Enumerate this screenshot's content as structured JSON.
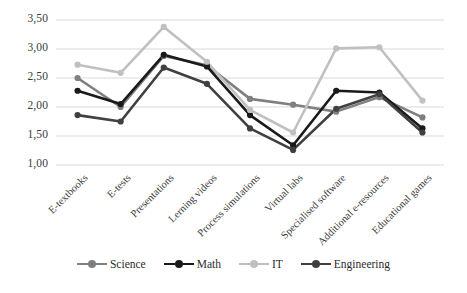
{
  "chart_data": {
    "type": "line",
    "title": "",
    "subtitle": "",
    "xlabel": "",
    "ylabel": "",
    "ylim": [
      1.0,
      3.5
    ],
    "ytick_labels": [
      "1,00",
      "1,50",
      "2,00",
      "2,50",
      "3,00",
      "3,50"
    ],
    "ytick_values": [
      1.0,
      1.5,
      2.0,
      2.5,
      3.0,
      3.5
    ],
    "grid": "horizontal",
    "legend_position": "bottom",
    "decimal_separator": ",",
    "categories": [
      "E-textbooks",
      "E-tests",
      "Presentations",
      "Lerning videos",
      "Process simulations",
      "Virtual labs",
      "Specialised software",
      "Additional e-resources",
      "Educational games"
    ],
    "series": [
      {
        "name": "Science",
        "color": "#7f7f7f",
        "values": [
          2.5,
          2.0,
          2.88,
          2.72,
          2.14,
          2.04,
          1.92,
          2.17,
          1.82
        ]
      },
      {
        "name": "Math",
        "color": "#1a1a1a",
        "values": [
          2.28,
          2.05,
          2.9,
          2.7,
          1.86,
          1.34,
          2.28,
          2.25,
          1.63
        ]
      },
      {
        "name": "IT",
        "color": "#c0c0c0",
        "values": [
          2.73,
          2.59,
          3.38,
          2.78,
          1.95,
          1.56,
          3.01,
          3.03,
          2.11
        ]
      },
      {
        "name": "Engineering",
        "color": "#404040",
        "values": [
          1.86,
          1.75,
          2.68,
          2.4,
          1.63,
          1.26,
          1.97,
          2.22,
          1.56
        ]
      }
    ]
  },
  "legend": {
    "items": [
      {
        "label": "Science"
      },
      {
        "label": "Math"
      },
      {
        "label": "IT"
      },
      {
        "label": "Engineering"
      }
    ]
  },
  "axes": {
    "gridline_color": "#d9d9d9",
    "tick_text_color": "#3a3a3a"
  }
}
